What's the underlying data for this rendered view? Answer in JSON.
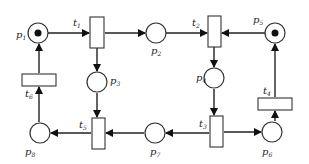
{
  "diagram": {
    "type": "petri-net",
    "places": [
      {
        "id": "p1",
        "name": "p",
        "sub": "1",
        "cx": 38,
        "cy": 33,
        "tokens": 1
      },
      {
        "id": "p2",
        "name": "p",
        "sub": "2",
        "cx": 156,
        "cy": 33,
        "tokens": 0
      },
      {
        "id": "p3",
        "name": "p",
        "sub": "3",
        "cx": 97,
        "cy": 82,
        "tokens": 0
      },
      {
        "id": "p4",
        "name": "p",
        "sub": "4",
        "cx": 214,
        "cy": 78,
        "tokens": 0
      },
      {
        "id": "p5",
        "name": "p",
        "sub": "5",
        "cx": 275,
        "cy": 33,
        "tokens": 1
      },
      {
        "id": "p6",
        "name": "p",
        "sub": "6",
        "cx": 272,
        "cy": 132,
        "tokens": 0
      },
      {
        "id": "p7",
        "name": "p",
        "sub": "7",
        "cx": 155,
        "cy": 133,
        "tokens": 0
      },
      {
        "id": "p8",
        "name": "p",
        "sub": "8",
        "cx": 40,
        "cy": 133,
        "tokens": 0
      }
    ],
    "transitions": [
      {
        "id": "t1",
        "name": "t",
        "sub": "1"
      },
      {
        "id": "t2",
        "name": "t",
        "sub": "2"
      },
      {
        "id": "t3",
        "name": "t",
        "sub": "3"
      },
      {
        "id": "t4",
        "name": "t",
        "sub": "4"
      },
      {
        "id": "t5",
        "name": "t",
        "sub": "5"
      },
      {
        "id": "t6",
        "name": "t",
        "sub": "6"
      }
    ],
    "arcs": [
      [
        "p1",
        "t1"
      ],
      [
        "t1",
        "p2"
      ],
      [
        "t1",
        "p3"
      ],
      [
        "p2",
        "t2"
      ],
      [
        "p5",
        "t2"
      ],
      [
        "t2",
        "p4"
      ],
      [
        "p4",
        "t3"
      ],
      [
        "t3",
        "p7"
      ],
      [
        "t3",
        "p6"
      ],
      [
        "p6",
        "t4"
      ],
      [
        "t4",
        "p5"
      ],
      [
        "p3",
        "t5"
      ],
      [
        "p7",
        "t5"
      ],
      [
        "t5",
        "p8"
      ],
      [
        "p8",
        "t6"
      ],
      [
        "t6",
        "p1"
      ]
    ]
  }
}
